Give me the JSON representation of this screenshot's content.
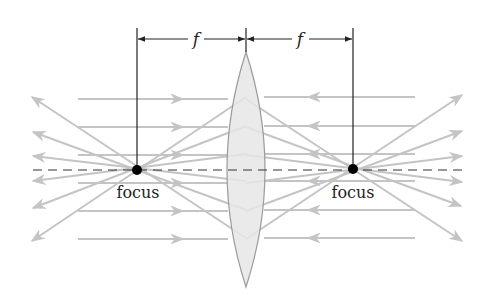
{
  "diagram": {
    "dimension_labels": {
      "left": "f",
      "right": "f"
    },
    "focus_labels": {
      "left": "focus",
      "right": "focus"
    },
    "colors": {
      "ray": "#c4c4c4",
      "lens_fill": "#e6e6e6",
      "lens_stroke": "#9a9a9a",
      "axis": "#333333",
      "dimension": "#222222",
      "focus_dot": "#000000",
      "text": "#222222"
    },
    "geometry": {
      "left_focus": [
        137,
        170
      ],
      "right_focus": [
        353,
        170
      ],
      "lens_center_x": 246,
      "lens_top_y": 52,
      "lens_bottom_y": 287,
      "axis_y": 170
    }
  }
}
